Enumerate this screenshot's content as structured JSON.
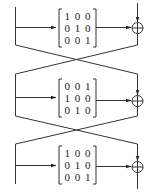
{
  "diagram": {
    "type": "block-diagram",
    "stages": [
      {
        "id": "stage-1",
        "matrix": [
          [
            "1",
            "0",
            "0"
          ],
          [
            "0",
            "1",
            "0"
          ],
          [
            "0",
            "0",
            "1"
          ]
        ],
        "matrix_rows": [
          "1 0 0",
          "0 1 0",
          "0 0 1"
        ],
        "operator": "xor"
      },
      {
        "id": "stage-2",
        "matrix": [
          [
            "0",
            "0",
            "1"
          ],
          [
            "1",
            "0",
            "0"
          ],
          [
            "0",
            "1",
            "0"
          ]
        ],
        "matrix_rows": [
          "0 0 1",
          "1 0 0",
          "0 1 0"
        ],
        "operator": "xor"
      },
      {
        "id": "stage-3",
        "matrix": [
          [
            "1",
            "0",
            "0"
          ],
          [
            "0",
            "1",
            "0"
          ],
          [
            "0",
            "0",
            "1"
          ]
        ],
        "matrix_rows": [
          "1 0 0",
          "0 1 0",
          "0 0 1"
        ],
        "operator": "xor"
      }
    ],
    "crossings": [
      {
        "between": [
          "stage-1",
          "stage-2"
        ]
      },
      {
        "between": [
          "stage-2",
          "stage-3"
        ]
      }
    ],
    "colors": {
      "line": "#333333",
      "background": "#ffffff"
    }
  }
}
